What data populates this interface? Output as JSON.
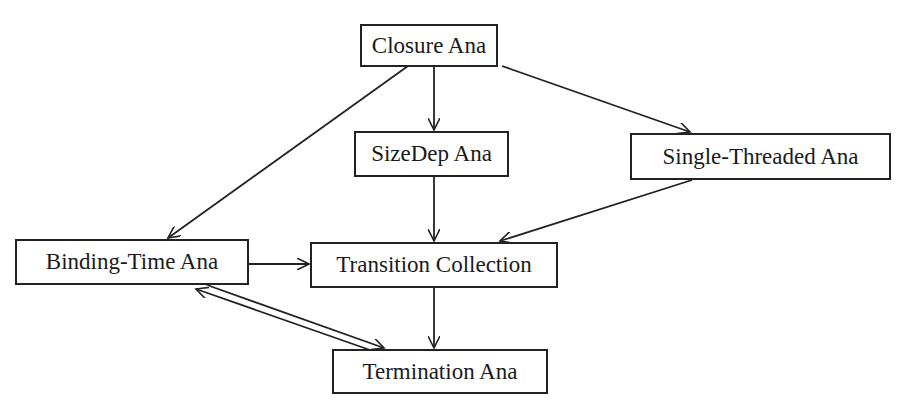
{
  "diagram": {
    "type": "flow-graph",
    "nodes": [
      {
        "id": "closure",
        "label": "Closure Ana"
      },
      {
        "id": "sizedep",
        "label": "SizeDep Ana"
      },
      {
        "id": "single",
        "label": "Single-Threaded Ana"
      },
      {
        "id": "binding",
        "label": "Binding-Time Ana"
      },
      {
        "id": "transition",
        "label": "Transition Collection"
      },
      {
        "id": "termination",
        "label": "Termination Ana"
      }
    ],
    "edges": [
      {
        "from": "closure",
        "to": "sizedep"
      },
      {
        "from": "closure",
        "to": "single"
      },
      {
        "from": "closure",
        "to": "binding"
      },
      {
        "from": "sizedep",
        "to": "transition"
      },
      {
        "from": "single",
        "to": "transition"
      },
      {
        "from": "binding",
        "to": "transition"
      },
      {
        "from": "transition",
        "to": "termination"
      },
      {
        "from": "binding",
        "to": "termination"
      },
      {
        "from": "termination",
        "to": "binding"
      }
    ],
    "colors": {
      "stroke": "#222222",
      "background": "#ffffff"
    }
  }
}
